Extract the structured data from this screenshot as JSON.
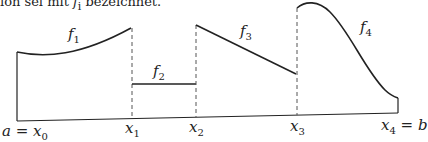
{
  "caption": {
    "prefix": "ion sei mit ",
    "symbol": "f",
    "subscript": "i",
    "suffix": " bezeichnet."
  },
  "functions": [
    {
      "name": "f",
      "sub": "1"
    },
    {
      "name": "f",
      "sub": "2"
    },
    {
      "name": "f",
      "sub": "3"
    },
    {
      "name": "f",
      "sub": "4"
    }
  ],
  "axis_labels": [
    {
      "prefix": "a = ",
      "name": "x",
      "sub": "0"
    },
    {
      "prefix": "",
      "name": "x",
      "sub": "1"
    },
    {
      "prefix": "",
      "name": "x",
      "sub": "2"
    },
    {
      "prefix": "",
      "name": "x",
      "sub": "3"
    },
    {
      "prefix": "",
      "name": "x",
      "sub": "4",
      "suffix": " = b"
    }
  ],
  "colors": {
    "stroke": "#222222",
    "dash": "#555555"
  }
}
